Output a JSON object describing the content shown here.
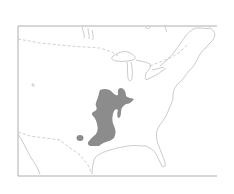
{
  "map": {
    "type": "species-range-map",
    "region": "eastern North America",
    "colors": {
      "background": "#ffffff",
      "frame": "#9a9a9a",
      "coastline": "#b5b5b5",
      "border_dashed": "#c2c2c2",
      "range_fill": "#8c8c8c"
    },
    "layers": [
      {
        "name": "frame",
        "visible": true
      },
      {
        "name": "coastlines-and-lakes",
        "visible": true
      },
      {
        "name": "international-borders",
        "style": "dashed",
        "visible": true
      },
      {
        "name": "range-area",
        "style": "filled",
        "visible": true
      },
      {
        "name": "outlier-population",
        "style": "filled",
        "visible": true
      }
    ]
  }
}
